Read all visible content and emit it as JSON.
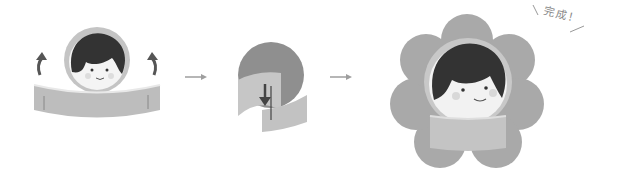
{
  "diagram": {
    "steps": [
      {
        "id": 1,
        "description": "Face medallion with band, arrows indicate folding band back"
      },
      {
        "id": 2,
        "description": "Band wrapped behind circle, arrow pointing down"
      },
      {
        "id": 3,
        "description": "Finished flower-shaped badge with face and band"
      }
    ],
    "arrows": [
      "→",
      "→"
    ],
    "completion_label": "完成！",
    "colors": {
      "background": "#ffffff",
      "hair": "#3a3a3a",
      "circle": "#9a9a9a",
      "circle_light": "#c9c9c9",
      "band": "#bdbdbd",
      "band_dark": "#a8a8a8",
      "flower": "#a9a9a9",
      "skin": "#f2f2f2",
      "arrow": "#9e9e9e",
      "cheek": "#d6d6d6"
    }
  }
}
